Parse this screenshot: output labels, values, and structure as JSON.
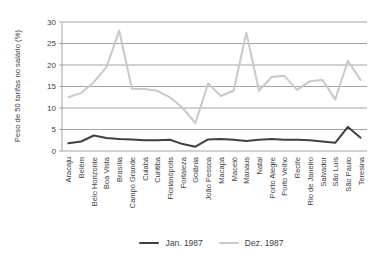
{
  "chart_data": {
    "type": "line",
    "title": "",
    "xlabel": "",
    "ylabel": "Peso de 50 tarifas no salário (%)",
    "ylim": [
      0,
      30
    ],
    "yticks": [
      0,
      5,
      10,
      15,
      20,
      25,
      30
    ],
    "grid": "horizontal",
    "legend_position": "bottom-center",
    "categories": [
      "Aracaju",
      "Belém",
      "Belo Horizonte",
      "Boa Vista",
      "Brasília",
      "Campo Grande",
      "Cuiabá",
      "Curitiba",
      "Florianópolis",
      "Fortaleza",
      "Goiânia",
      "João Pessoa",
      "Macapá",
      "Maceió",
      "Manaus",
      "Natal",
      "Porto Alegre",
      "Porto Velho",
      "Recife",
      "Rio de Janeiro",
      "Salvador",
      "São Luís",
      "São Paulo",
      "Teresina"
    ],
    "series": [
      {
        "name": "Jan. 1987",
        "color": "#404040",
        "values": [
          1.8,
          2.2,
          3.6,
          3.0,
          2.8,
          2.7,
          2.5,
          2.5,
          2.6,
          1.6,
          1.0,
          2.7,
          2.8,
          2.6,
          2.3,
          2.6,
          2.8,
          2.6,
          2.6,
          2.5,
          2.2,
          1.9,
          5.6,
          3.1
        ]
      },
      {
        "name": "Dez. 1987",
        "color": "#c9c9c9",
        "values": [
          12.5,
          13.5,
          16.0,
          19.5,
          28.0,
          14.5,
          14.4,
          14.0,
          12.5,
          10.0,
          6.5,
          15.7,
          12.8,
          14.0,
          27.5,
          14.0,
          17.2,
          17.5,
          14.2,
          16.2,
          16.5,
          12.0,
          21.0,
          16.5
        ]
      }
    ]
  },
  "colors": {
    "background": "#ffffff",
    "grid": "#a3a3a3",
    "axis": "#a3a3a3",
    "text": "#3d3d3d"
  }
}
